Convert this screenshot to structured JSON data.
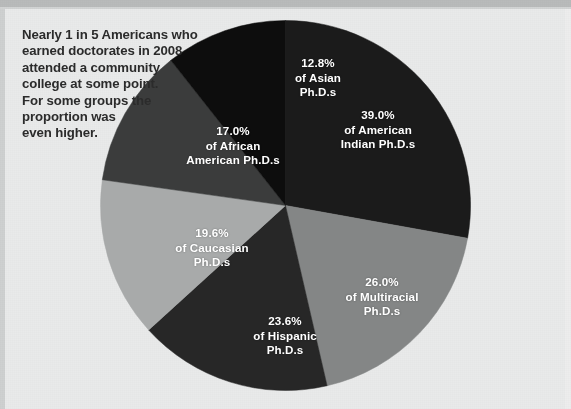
{
  "caption": {
    "text": "Nearly 1 in 5 Americans who\nearned doctorates in 2008\nattended a community\ncollege at some point.\nFor some groups the\nproportion was\neven higher."
  },
  "colors": {
    "background": "#e9eaea",
    "top_band": "#b9bbbb",
    "label_text": "#ffffff",
    "caption_text": "#2b2b2b"
  },
  "chart_data": {
    "type": "pie",
    "title": "",
    "subtitle": "",
    "xlabel": "",
    "ylabel": "",
    "legend_position": "none",
    "labels_inside": true,
    "categories": [
      "American Indian",
      "Multiracial",
      "Hispanic",
      "Caucasian",
      "African American",
      "Asian"
    ],
    "values": [
      39.0,
      26.0,
      23.6,
      19.6,
      17.0,
      12.8
    ],
    "value_suffix": "%",
    "slices": [
      {
        "name": "american-indian",
        "percent": "39.0%",
        "line2": "of American",
        "line3": "Indian Ph.D.s",
        "value": 39.0,
        "color": "#1b1b1b",
        "start_angle": 0,
        "end_angle": 100.2,
        "label_x": 278,
        "label_y": 88
      },
      {
        "name": "multiracial",
        "percent": "26.0%",
        "line2": "of Multiracial",
        "line3": "Ph.D.s",
        "value": 26.0,
        "color": "#848686",
        "start_angle": 100.2,
        "end_angle": 167.0,
        "label_x": 282,
        "label_y": 255
      },
      {
        "name": "hispanic",
        "percent": "23.6%",
        "line2": "of Hispanic",
        "line3": "Ph.D.s",
        "value": 23.6,
        "color": "#272727",
        "start_angle": 167.0,
        "end_angle": 227.7,
        "label_x": 185,
        "label_y": 294
      },
      {
        "name": "caucasian",
        "percent": "19.6%",
        "line2": "of Caucasian",
        "line3": "Ph.D.s",
        "value": 19.6,
        "color": "#a8aaaa",
        "start_angle": 227.7,
        "end_angle": 278.0,
        "label_x": 112,
        "label_y": 206
      },
      {
        "name": "african-american",
        "percent": "17.0%",
        "line2": "of African",
        "line3": "American Ph.D.s",
        "value": 17.0,
        "color": "#3b3c3c",
        "start_angle": 278.0,
        "end_angle": 321.7,
        "label_x": 133,
        "label_y": 104
      },
      {
        "name": "asian",
        "percent": "12.8%",
        "line2": "of Asian",
        "line3": "Ph.D.s",
        "value": 12.8,
        "color": "#0d0d0d",
        "start_angle": 321.7,
        "end_angle": 360,
        "label_x": 218,
        "label_y": 36
      }
    ]
  }
}
